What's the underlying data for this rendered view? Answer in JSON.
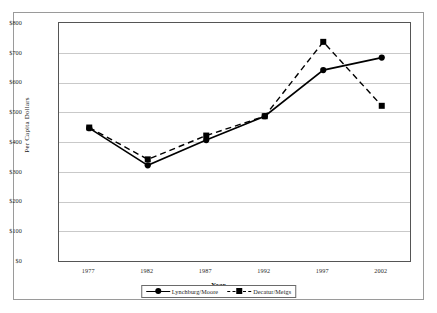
{
  "chart_data": {
    "type": "line",
    "title": "",
    "xlabel": "Year",
    "ylabel": "Per Capita Dollars",
    "categories": [
      "1977",
      "1982",
      "1987",
      "1992",
      "1997",
      "2002"
    ],
    "x": [
      1977,
      1982,
      1987,
      1992,
      1997,
      2002
    ],
    "ylim": [
      0,
      800
    ],
    "ytick_labels": [
      "$800",
      "$700",
      "$600",
      "$500",
      "$400",
      "$300",
      "$200",
      "$100",
      "$0"
    ],
    "ytick_values": [
      800,
      700,
      600,
      500,
      400,
      300,
      200,
      100,
      0
    ],
    "ytick_step": 100,
    "grid": true,
    "legend_position": "bottom-center",
    "series": [
      {
        "name": "Lynchburg/Moore",
        "values": [
          450,
          325,
          410,
          490,
          645,
          687
        ],
        "line_style": "solid",
        "marker": "circle",
        "color": "#000000"
      },
      {
        "name": "Decatur/Meigs",
        "values": [
          452,
          345,
          425,
          490,
          740,
          525
        ],
        "line_style": "dashed",
        "marker": "square",
        "color": "#000000"
      }
    ]
  },
  "legend": {
    "entries": [
      {
        "label": "Lynchburg/Moore"
      },
      {
        "label": "Decatur/Meigs"
      }
    ]
  },
  "colors": {
    "grid": "#c9c9c9",
    "axis": "#555555",
    "frame": "#9a9a9a",
    "series": "#000000",
    "background": "#ffffff"
  }
}
